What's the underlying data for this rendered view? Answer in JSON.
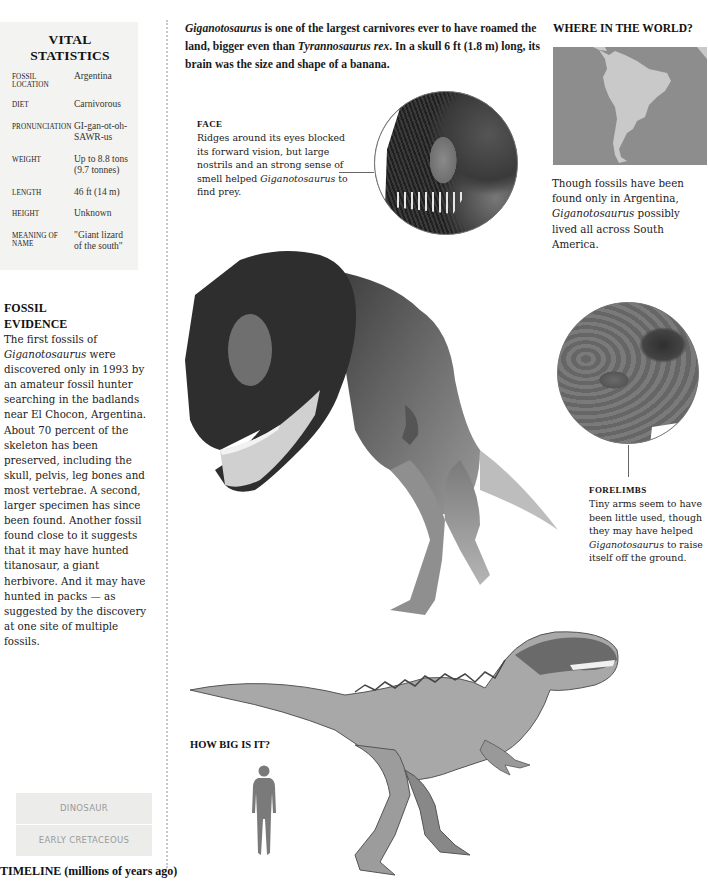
{
  "vital_statistics": {
    "title": "VITAL STATISTICS",
    "rows": [
      {
        "label": "Fossil Location",
        "value": "Argentina"
      },
      {
        "label": "Diet",
        "value": "Carnivorous"
      },
      {
        "label": "Pronunciation",
        "value": "GI-gan-ot-oh-SAWR-us"
      },
      {
        "label": "Weight",
        "value": "Up to 8.8 tons (9.7 tonnes)"
      },
      {
        "label": "Length",
        "value": "46 ft (14 m)"
      },
      {
        "label": "Height",
        "value": "Unknown"
      },
      {
        "label": "Meaning of name",
        "value": "\"Giant lizard of the south\""
      }
    ]
  },
  "fossil_evidence": {
    "title_line1": "FOSSIL",
    "title_line2": "EVIDENCE",
    "body_italic_start": "Giganotosaurus",
    "body_pre": "The first fossils of ",
    "body_post": " were discovered only in 1993 by an amateur fossil hunter searching in the badlands near El Chocon, Argentina. About 70 percent of the skeleton has been preserved, including the skull, pelvis, leg bones and most vertebrae. A second, larger specimen has since been found. Another fossil found close to it suggests that it may have hunted titanosaur, a giant herbivore. And it may have hunted in packs — as suggested by the discovery at one site of multiple fossils."
  },
  "timeline": {
    "boxes": [
      "DINOSAUR",
      "EARLY CRETACEOUS"
    ],
    "title": "TIMELINE (millions of years ago)"
  },
  "intro": {
    "name": "Giganotosaurus",
    "part1": " is one of the largest carnivores ever to have roamed the land, bigger even than ",
    "trex": "Tyrannosaurus rex",
    "part2": ". In a skull 6 ft (1.8 m) long, its brain was the size and shape of a banana."
  },
  "face": {
    "title": "Face",
    "body": "Ridges around its eyes blocked its forward vision, but large nostrils and an strong sense of smell helped ",
    "name": "Giganotosaurus",
    "body_end": " to find prey."
  },
  "where_in_world": {
    "title": "WHERE IN THE WORLD?",
    "caption_pre": "Though fossils have been found only in Argentina, ",
    "caption_name": "Giganotosaurus",
    "caption_post": " possibly lived all across South America.",
    "map_colors": {
      "ocean": "#8d8d8d",
      "land": "#c9c9c9"
    }
  },
  "forelimbs": {
    "title": "Forelimbs",
    "body_pre": "Tiny arms seem to have been little used, though they may have helped ",
    "name": "Giganotosaurus",
    "body_post": " to raise itself off the ground."
  },
  "how_big": {
    "title": "HOW BIG IS IT?"
  }
}
